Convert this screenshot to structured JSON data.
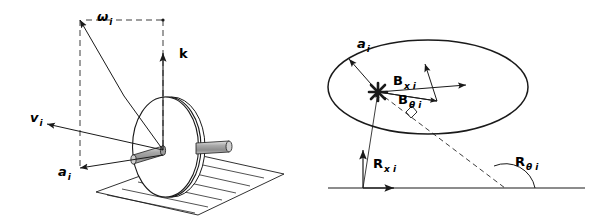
{
  "figure": {
    "background_color": "#ffffff",
    "stroke_color": "#1a1a1a",
    "axle_fill_color": "#b0b0b0",
    "panels": [
      {
        "id": "left-panel",
        "name": "wheel-3d-kinematics-panel",
        "description": "Three dimensional view of a wheel on a hatched ground plane with angular velocity, linear velocity, unit normal and contact point vectors",
        "labels": [
          {
            "key": "omega",
            "base": "ω",
            "sub": "i",
            "name": "omega-i-label",
            "x": 97,
            "y": 21
          },
          {
            "key": "k",
            "base": "k",
            "sub": "",
            "name": "k-label",
            "x": 179,
            "y": 58,
            "roman": true
          },
          {
            "key": "v",
            "base": "v",
            "sub": "i",
            "name": "v-i-label",
            "x": 30,
            "y": 122
          },
          {
            "key": "a",
            "base": "a",
            "sub": "i",
            "name": "a-i-label",
            "x": 58,
            "y": 176
          }
        ]
      },
      {
        "id": "right-panel",
        "name": "contact-patch-force-panel",
        "description": "Elliptical contact region with force components, base line, reaction vectors and angle measure",
        "labels": [
          {
            "key": "a",
            "base": "a",
            "sub": "i",
            "name": "a-i-label",
            "x": 357,
            "y": 48
          },
          {
            "key": "Bx",
            "base": "B",
            "sub": "x i",
            "name": "b-x-i-label",
            "x": 393,
            "y": 85
          },
          {
            "key": "Btheta",
            "base": "B",
            "sub": "θ i",
            "name": "b-theta-i-label",
            "x": 398,
            "y": 102
          },
          {
            "key": "Rx",
            "base": "R",
            "sub": "x i",
            "name": "r-x-i-label",
            "x": 373,
            "y": 168
          },
          {
            "key": "Rtheta",
            "base": "R",
            "sub": "θ i",
            "name": "r-theta-i-label",
            "x": 515,
            "y": 166
          }
        ]
      }
    ]
  }
}
